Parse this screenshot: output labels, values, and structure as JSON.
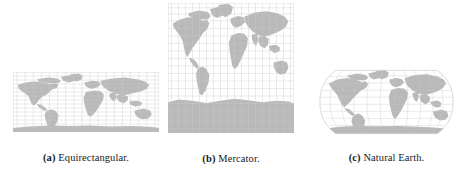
{
  "figure": {
    "panels": [
      {
        "id": "equirectangular",
        "tag": "(a)",
        "label": "Equirectangular.",
        "caption_full": "(a) Equirectangular.",
        "projection": "equirectangular",
        "outline_shape": "rectangle",
        "graticule": {
          "meridian_step_deg": 10,
          "parallel_step_deg": 10
        }
      },
      {
        "id": "mercator",
        "tag": "(b)",
        "label": "Mercator.",
        "caption_full": "(b) Mercator.",
        "projection": "mercator",
        "outline_shape": "rectangle",
        "graticule": {
          "meridian_step_deg": 10,
          "parallel_step_deg": 10
        }
      },
      {
        "id": "naturalearth",
        "tag": "(c)",
        "label": "Natural Earth.",
        "caption_full": "(c) Natural Earth.",
        "projection": "natural-earth",
        "outline_shape": "rounded-pseudocylindrical",
        "graticule": {
          "meridian_step_deg": 10,
          "parallel_step_deg": 10
        }
      }
    ]
  },
  "colors": {
    "background": "#ffffff",
    "land_fill": "#b4b4b4",
    "graticule_stroke": "#c9c9c9",
    "frame_stroke": "#c2c2c2",
    "caption_text": "#1a1a1a"
  }
}
